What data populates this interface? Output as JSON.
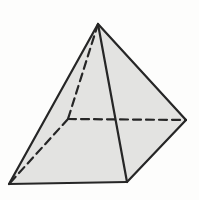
{
  "figure": {
    "type": "square-pyramid-line-drawing",
    "background_color": "#fdfdfc",
    "face_fill_color": "#e3e3e1",
    "edge_color": "#262626",
    "edge_width": 2.2,
    "hidden_edge_dash": "8 5",
    "canvas": {
      "width": 199,
      "height": 200
    },
    "vertices": {
      "apex": [
        98,
        24
      ],
      "base_front_left": [
        9,
        184
      ],
      "base_front_right": [
        127,
        182
      ],
      "base_right": [
        186,
        120
      ],
      "base_back": [
        68,
        119
      ]
    },
    "faces": [
      {
        "name": "pyramid-face-front-left",
        "vertices": [
          "apex",
          "base_front_left",
          "base_front_right"
        ]
      },
      {
        "name": "pyramid-face-front-right",
        "vertices": [
          "apex",
          "base_front_right",
          "base_right"
        ]
      }
    ],
    "visible_edges": [
      [
        "apex",
        "base_front_left"
      ],
      [
        "apex",
        "base_front_right"
      ],
      [
        "apex",
        "base_right"
      ],
      [
        "base_front_left",
        "base_front_right"
      ],
      [
        "base_front_right",
        "base_right"
      ]
    ],
    "hidden_edges": [
      [
        "apex",
        "base_back"
      ],
      [
        "base_back",
        "base_right"
      ],
      [
        "base_back",
        "base_front_left"
      ]
    ]
  }
}
